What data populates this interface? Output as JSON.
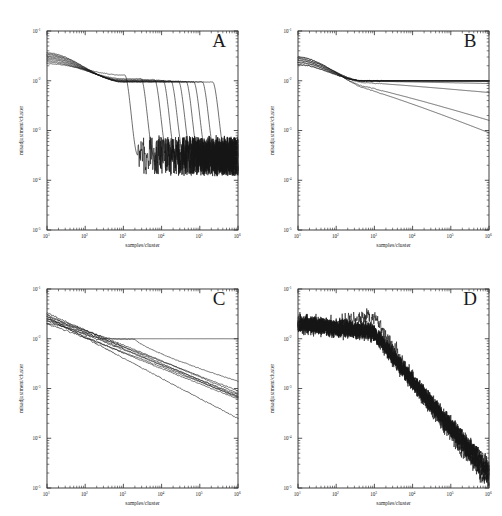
{
  "figure": {
    "layout": "2x2 grid of log-log line plots",
    "panels": [
      "A",
      "B",
      "C",
      "D"
    ]
  },
  "axes": {
    "xlabel": "samples/cluster",
    "ylabel": "misadjustment/cluster",
    "x_ticklabels": [
      "10",
      "10",
      "10",
      "10",
      "10",
      "10"
    ],
    "x_exponents": [
      "1",
      "2",
      "3",
      "4",
      "5",
      "6"
    ],
    "y_ticklabels": [
      "10",
      "10",
      "10",
      "10",
      "10"
    ],
    "y_exponents": [
      "-1",
      "-2",
      "-3",
      "-4",
      "-5"
    ],
    "xlim": [
      10,
      1000000
    ],
    "ylim": [
      1e-05,
      0.1
    ],
    "xscale": "log",
    "yscale": "log",
    "grid": false,
    "ticks": "minor log ticks on all four sides, inward"
  },
  "colors": {
    "trace": "#151515",
    "axis": "#2b2b2b",
    "background": "#ffffff",
    "text": "#1d1d1d"
  },
  "chart_data": [
    {
      "type": "line",
      "title": "A",
      "xlabel": "samples/cluster",
      "ylabel": "misadjustment/cluster",
      "xlim": [
        10,
        1000000
      ],
      "ylim": [
        1e-05,
        0.1
      ],
      "xscale": "log",
      "yscale": "log",
      "grid": false,
      "legend": "none",
      "description": "Ten traces start near 2.5e-2, decay slowly to a shared shoulder near 1e-2, then each drops off a steep cliff at a staggered sample count between 1.5e3 and 3e5, collapsing into a dense noisy floor around 3e-4.",
      "n_series": 10,
      "series": [
        {
          "name": "run-1",
          "cliff_x": 1500,
          "plateau_y": 0.013,
          "floor_y": 0.00032
        },
        {
          "name": "run-2",
          "cliff_x": 4000,
          "plateau_y": 0.011,
          "floor_y": 0.0003
        },
        {
          "name": "run-3",
          "cliff_x": 9000,
          "plateau_y": 0.0105,
          "floor_y": 0.00031
        },
        {
          "name": "run-4",
          "cliff_x": 15000,
          "plateau_y": 0.0102,
          "floor_y": 0.00029
        },
        {
          "name": "run-5",
          "cliff_x": 24000,
          "plateau_y": 0.01,
          "floor_y": 0.00033
        },
        {
          "name": "run-6",
          "cliff_x": 38000,
          "plateau_y": 0.0098,
          "floor_y": 0.0003
        },
        {
          "name": "run-7",
          "cliff_x": 60000,
          "plateau_y": 0.0097,
          "floor_y": 0.00028
        },
        {
          "name": "run-8",
          "cliff_x": 95000,
          "plateau_y": 0.0096,
          "floor_y": 0.00031
        },
        {
          "name": "run-9",
          "cliff_x": 160000,
          "plateau_y": 0.0095,
          "floor_y": 0.0003
        },
        {
          "name": "run-10",
          "cliff_x": 300000,
          "plateau_y": 0.0094,
          "floor_y": 0.00029
        }
      ],
      "noise_floor": 0.0003,
      "noise_onset_x": 20000
    },
    {
      "type": "line",
      "title": "B",
      "xlabel": "samples/cluster",
      "ylabel": "misadjustment/cluster",
      "xlim": [
        10,
        1000000
      ],
      "ylim": [
        1e-05,
        0.1
      ],
      "xscale": "log",
      "yscale": "log",
      "grid": false,
      "legend": "none",
      "description": "Traces begin near 2.5e-2 and converge; most flatten onto a plateau at 1e-2 extending to 1e6, while three or four break away and decay as power laws reaching 9e-4 to 6e-3 at the right edge.",
      "n_series": 10,
      "series": [
        {
          "name": "run-1",
          "end_y": 0.01,
          "behavior": "plateau"
        },
        {
          "name": "run-2",
          "end_y": 0.01,
          "behavior": "plateau"
        },
        {
          "name": "run-3",
          "end_y": 0.0099,
          "behavior": "plateau"
        },
        {
          "name": "run-4",
          "end_y": 0.0101,
          "behavior": "plateau"
        },
        {
          "name": "run-5",
          "end_y": 0.0098,
          "behavior": "plateau"
        },
        {
          "name": "run-6",
          "end_y": 0.0097,
          "behavior": "plateau"
        },
        {
          "name": "run-7",
          "end_y": 0.0088,
          "behavior": "slight-decay"
        },
        {
          "name": "run-8",
          "end_y": 0.0058,
          "behavior": "decay"
        },
        {
          "name": "run-9",
          "end_y": 0.0016,
          "behavior": "decay"
        },
        {
          "name": "run-10",
          "end_y": 0.0009,
          "behavior": "decay"
        }
      ],
      "plateau_y": 0.01
    },
    {
      "type": "line",
      "title": "C",
      "xlabel": "samples/cluster",
      "ylabel": "misadjustment/cluster",
      "xlim": [
        10,
        1000000
      ],
      "ylim": [
        1e-05,
        0.1
      ],
      "xscale": "log",
      "yscale": "log",
      "grid": false,
      "legend": "none",
      "description": "A tight bundle decays steadily as a power law from 2.5e-2 down to roughly 7e-5 at 1e6, with one outlier that flattens at 1e-2 across the whole range and a second that lags before rejoining the decay.",
      "n_series": 10,
      "series": [
        {
          "name": "run-1",
          "end_y": 0.01,
          "behavior": "flat-outlier"
        },
        {
          "name": "run-2",
          "end_y": 0.0014,
          "behavior": "late-decay"
        },
        {
          "name": "run-3",
          "end_y": 0.0009,
          "behavior": "decay"
        },
        {
          "name": "run-4",
          "end_y": 0.0008,
          "behavior": "decay"
        },
        {
          "name": "run-5",
          "end_y": 0.00075,
          "behavior": "decay"
        },
        {
          "name": "run-6",
          "end_y": 0.0007,
          "behavior": "decay"
        },
        {
          "name": "run-7",
          "end_y": 0.00068,
          "behavior": "decay"
        },
        {
          "name": "run-8",
          "end_y": 0.00065,
          "behavior": "decay"
        },
        {
          "name": "run-9",
          "end_y": 0.00062,
          "behavior": "decay"
        },
        {
          "name": "run-10",
          "end_y": 0.00025,
          "behavior": "fast-decay"
        }
      ]
    },
    {
      "type": "line",
      "title": "D",
      "xlabel": "samples/cluster",
      "ylabel": "misadjustment/cluster",
      "xlim": [
        10,
        1000000
      ],
      "ylim": [
        1e-05,
        0.1
      ],
      "xscale": "log",
      "yscale": "log",
      "grid": false,
      "legend": "none",
      "description": "Ten heavily noisy traces overlap as one broad band, holding near 2e-2 until about 1e3 samples then falling steeply and noisily to about 2e-5 at 1e6, with one trace running high through the mid range.",
      "n_series": 10,
      "knee_x": 1000,
      "start_y": 0.02,
      "end_y": 2e-05,
      "series": [
        {
          "name": "run-1",
          "end_y": 3e-05
        },
        {
          "name": "run-2",
          "end_y": 2.6e-05
        },
        {
          "name": "run-3",
          "end_y": 2.4e-05
        },
        {
          "name": "run-4",
          "end_y": 2.2e-05
        },
        {
          "name": "run-5",
          "end_y": 2.1e-05
        },
        {
          "name": "run-6",
          "end_y": 1.9e-05
        },
        {
          "name": "run-7",
          "end_y": 1.8e-05
        },
        {
          "name": "run-8",
          "end_y": 1.6e-05
        },
        {
          "name": "run-9",
          "end_y": 1.4e-05
        },
        {
          "name": "run-10",
          "end_y": 1.2e-05
        }
      ]
    }
  ]
}
